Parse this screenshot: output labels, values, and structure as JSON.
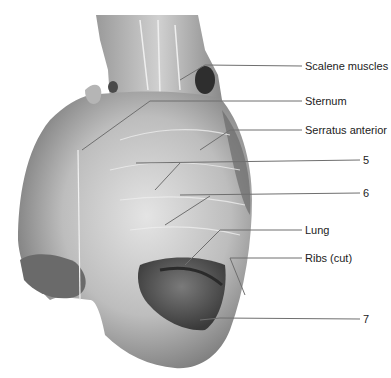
{
  "figure": {
    "colors": {
      "background": "#ffffff",
      "tissue_light": "#d9d9d9",
      "tissue_mid": "#a9a9a9",
      "tissue_dark": "#5e5e5e",
      "leader_line": "#6f6f6f",
      "label_text": "#222222"
    },
    "labels": [
      {
        "id": "scalene-muscles",
        "text": "Scalene muscles",
        "x": 305,
        "y": 60
      },
      {
        "id": "sternum",
        "text": "Sternum",
        "x": 305,
        "y": 95
      },
      {
        "id": "serratus-anterior",
        "text": "Serratus anterior",
        "x": 305,
        "y": 124
      },
      {
        "id": "rib-5",
        "text": "5",
        "x": 363,
        "y": 154
      },
      {
        "id": "rib-6",
        "text": "6",
        "x": 363,
        "y": 187
      },
      {
        "id": "lung",
        "text": "Lung",
        "x": 305,
        "y": 224
      },
      {
        "id": "ribs-cut",
        "text": "Ribs (cut)",
        "x": 305,
        "y": 252
      },
      {
        "id": "rib-7",
        "text": "7",
        "x": 363,
        "y": 313
      }
    ]
  }
}
